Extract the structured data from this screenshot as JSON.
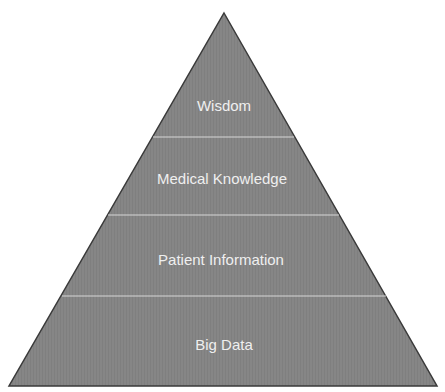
{
  "diagram": {
    "type": "pyramid",
    "colors": {
      "fill": "#858585",
      "outline": "#3a3a3a",
      "divider": "#d6d6d6",
      "text": "#efefef"
    },
    "levels": [
      {
        "label": "Wisdom"
      },
      {
        "label": "Medical Knowledge"
      },
      {
        "label": "Patient Information"
      },
      {
        "label": "Big Data"
      }
    ]
  }
}
